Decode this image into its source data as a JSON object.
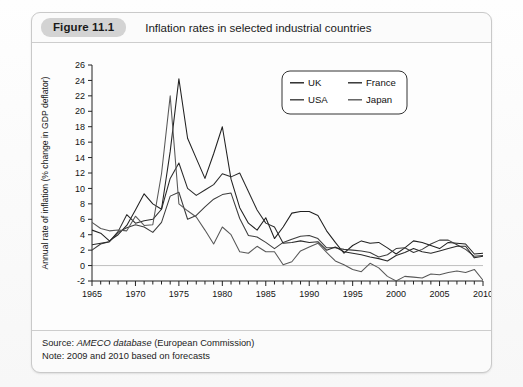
{
  "figure": {
    "badge": "Figure 11.1",
    "caption": "Inflation rates in selected industrial countries",
    "source_prefix": "Source: ",
    "source_em": "AMECO database",
    "source_suffix": " (European Commission)",
    "note": "Note: 2009 and 2010 based on forecasts"
  },
  "chart_data": {
    "type": "line",
    "title": "Inflation rates in selected industrial countries",
    "xlabel": "",
    "ylabel": "Annual rate of inflation (% change in GDP deflator)",
    "xlim": [
      1965,
      2010
    ],
    "ylim": [
      -2,
      26
    ],
    "ytick_step": 2,
    "yticks": [
      -2,
      0,
      2,
      4,
      6,
      8,
      10,
      12,
      14,
      16,
      18,
      20,
      22,
      24,
      26
    ],
    "xticks": [
      1965,
      1970,
      1975,
      1980,
      1985,
      1990,
      1995,
      2000,
      2005,
      2010
    ],
    "xtick_minor_step": 1,
    "grid": "zero-line-only",
    "legend_position": "top-right",
    "x": [
      1965,
      1966,
      1967,
      1968,
      1969,
      1970,
      1971,
      1972,
      1973,
      1974,
      1975,
      1976,
      1977,
      1978,
      1979,
      1980,
      1981,
      1982,
      1983,
      1984,
      1985,
      1986,
      1987,
      1988,
      1989,
      1990,
      1991,
      1992,
      1993,
      1994,
      1995,
      1996,
      1997,
      1998,
      1999,
      2000,
      2001,
      2002,
      2003,
      2004,
      2005,
      2006,
      2007,
      2008,
      2009,
      2010
    ],
    "series": [
      {
        "name": "UK",
        "color": "#202020",
        "values": [
          4.6,
          4.2,
          3.2,
          4.0,
          5.2,
          7.2,
          9.3,
          8.0,
          7.3,
          14.8,
          24.2,
          16.5,
          13.9,
          11.3,
          14.5,
          18.0,
          11.2,
          7.5,
          5.5,
          4.6,
          6.2,
          3.5,
          5.0,
          6.8,
          7.0,
          7.0,
          6.5,
          4.5,
          3.0,
          1.6,
          2.6,
          3.2,
          2.9,
          3.0,
          2.3,
          1.5,
          2.3,
          3.2,
          3.0,
          2.6,
          2.2,
          3.0,
          2.9,
          2.8,
          1.5,
          1.6
        ]
      },
      {
        "name": "USA",
        "color": "#3c3c3c",
        "values": [
          2.0,
          2.8,
          3.1,
          4.3,
          4.9,
          5.3,
          5.0,
          4.3,
          5.6,
          9.0,
          9.5,
          6.0,
          6.5,
          7.6,
          8.6,
          9.2,
          9.4,
          6.1,
          3.9,
          3.7,
          3.0,
          2.2,
          3.0,
          3.4,
          3.8,
          3.9,
          3.5,
          2.3,
          2.3,
          2.1,
          2.0,
          1.9,
          1.7,
          1.1,
          1.4,
          2.2,
          2.3,
          1.7,
          2.1,
          2.8,
          3.3,
          3.3,
          2.7,
          2.1,
          1.2,
          1.3
        ]
      },
      {
        "name": "France",
        "color": "#2a2a2a",
        "values": [
          2.7,
          2.9,
          3.1,
          4.4,
          6.6,
          5.5,
          5.8,
          6.0,
          7.3,
          11.3,
          13.3,
          10.0,
          9.1,
          9.8,
          10.5,
          11.9,
          11.5,
          12.0,
          9.6,
          7.2,
          5.5,
          5.0,
          2.9,
          3.0,
          3.2,
          3.0,
          3.1,
          2.0,
          2.4,
          1.8,
          1.6,
          1.4,
          1.1,
          0.9,
          0.6,
          1.3,
          1.7,
          2.2,
          1.8,
          1.6,
          1.9,
          2.2,
          2.5,
          2.5,
          1.0,
          1.2
        ]
      },
      {
        "name": "Japan",
        "color": "#585858",
        "values": [
          5.6,
          4.8,
          4.5,
          4.6,
          4.5,
          6.4,
          5.2,
          5.3,
          11.9,
          22.0,
          8.0,
          7.1,
          6.3,
          4.6,
          2.8,
          5.0,
          4.0,
          1.8,
          1.6,
          2.5,
          1.8,
          1.8,
          0.1,
          0.5,
          1.9,
          2.4,
          2.9,
          1.7,
          0.6,
          0.1,
          -0.5,
          -0.8,
          0.3,
          -0.3,
          -1.4,
          -2.0,
          -1.4,
          -1.5,
          -1.6,
          -1.1,
          -1.2,
          -0.9,
          -0.7,
          -0.9,
          -0.5,
          -1.9
        ]
      }
    ],
    "legend": [
      "UK",
      "France",
      "USA",
      "Japan"
    ]
  },
  "colors": {
    "badge_bg": "#d3d3d3",
    "panel_border": "#c9c9c9",
    "zero_gridline": "#bfbfbf",
    "axis": "#222222"
  }
}
